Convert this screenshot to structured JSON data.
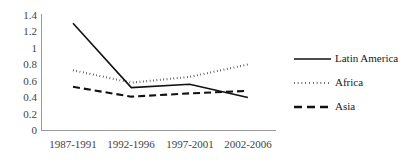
{
  "chart_data": {
    "type": "line",
    "title": "",
    "subtitle": "",
    "xlabel": "",
    "ylabel": "",
    "categories": [
      "1987-1991",
      "1992-1996",
      "1997-2001",
      "2002-2006"
    ],
    "series": [
      {
        "name": "Latin America",
        "style": "solid",
        "color": "#111111",
        "values": [
          1.3,
          0.52,
          0.56,
          0.4
        ]
      },
      {
        "name": "Africa",
        "style": "dotted",
        "color": "#111111",
        "values": [
          0.73,
          0.58,
          0.65,
          0.8
        ]
      },
      {
        "name": "Asia",
        "style": "dashed",
        "color": "#111111",
        "values": [
          0.53,
          0.41,
          0.45,
          0.48
        ]
      }
    ],
    "ylim": [
      0,
      1.4
    ],
    "y_ticks": [
      0,
      0.2,
      0.4,
      0.6,
      0.8,
      1.0,
      1.2,
      1.4
    ],
    "y_tick_labels": [
      "0",
      "0.2",
      "0.4",
      "0.6",
      "0.8",
      "1",
      "1.2",
      "1.4"
    ],
    "grid": false,
    "legend_position": "right"
  },
  "axis": {
    "y_tick_labels": [
      "1.4",
      "1.2",
      "1",
      "0.8",
      "0.6",
      "0.4",
      "0.2",
      "0"
    ],
    "x_tick_labels": [
      "1987-1991",
      "1992-1996",
      "1997-2001",
      "2002-2006"
    ]
  },
  "legend": {
    "entries": [
      {
        "label": "Latin America",
        "style": "solid"
      },
      {
        "label": "Africa",
        "style": "dotted"
      },
      {
        "label": "Asia",
        "style": "dashed"
      }
    ]
  },
  "colors": {
    "series": "#111111",
    "axis": "#9a9a9a",
    "tick_text": "#3f3f3f",
    "legend_text": "#1a1a1a",
    "background": "#ffffff"
  }
}
